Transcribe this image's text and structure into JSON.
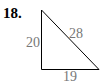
{
  "problem_number": "18.",
  "triangle": {
    "type": "right",
    "sides": {
      "left_vertical": "20",
      "hypotenuse": "28",
      "bottom_horizontal": "19"
    },
    "stroke_color": "#000000",
    "label_color": "#777777"
  }
}
